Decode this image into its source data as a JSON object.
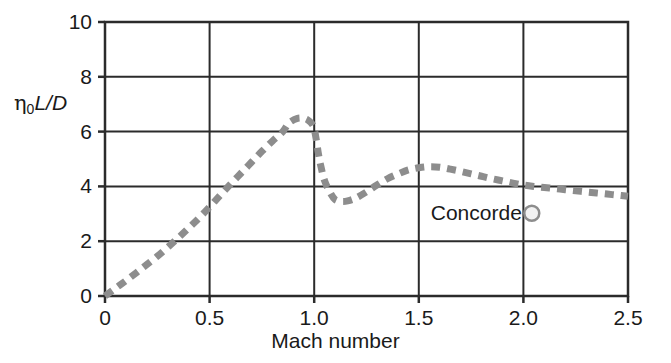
{
  "chart_data": {
    "type": "line",
    "title": "",
    "xlabel": "Mach number",
    "ylabel": "η0L/D",
    "ylabel_parts": {
      "symbol": "η",
      "subscript": "0",
      "italic": "L/D"
    },
    "xlim": [
      0,
      2.5
    ],
    "ylim": [
      0,
      10
    ],
    "xticks": [
      "0",
      "0.5",
      "1.0",
      "1.5",
      "2.0",
      "2.5"
    ],
    "xtick_values": [
      0,
      0.5,
      1.0,
      1.5,
      2.0,
      2.5
    ],
    "yticks": [
      "0",
      "2",
      "4",
      "6",
      "8",
      "10"
    ],
    "ytick_values": [
      0,
      2,
      4,
      6,
      8,
      10
    ],
    "grid": true,
    "grid_color": "#2b2b2b",
    "legend": null,
    "series": [
      {
        "name": "Overall efficiency envelope",
        "style": "dashed",
        "color": "#8d8d8d",
        "linewidth": 7,
        "dash": "9 7",
        "x": [
          0.0,
          0.05,
          0.1,
          0.15,
          0.2,
          0.25,
          0.3,
          0.35,
          0.4,
          0.45,
          0.5,
          0.55,
          0.6,
          0.65,
          0.7,
          0.75,
          0.8,
          0.85,
          0.88,
          0.92,
          0.95,
          0.97,
          0.99,
          1.0,
          1.01,
          1.02,
          1.03,
          1.05,
          1.08,
          1.1,
          1.13,
          1.16,
          1.2,
          1.25,
          1.3,
          1.35,
          1.4,
          1.45,
          1.5,
          1.55,
          1.6,
          1.65,
          1.7,
          1.75,
          1.8,
          1.85,
          1.9,
          1.95,
          2.0,
          2.05,
          2.1,
          2.15,
          2.2,
          2.25,
          2.3,
          2.35,
          2.4,
          2.45,
          2.5
        ],
        "y": [
          0.0,
          0.28,
          0.56,
          0.85,
          1.15,
          1.45,
          1.78,
          2.12,
          2.48,
          2.85,
          3.25,
          3.67,
          4.08,
          4.48,
          4.88,
          5.28,
          5.65,
          6.0,
          6.32,
          6.48,
          6.48,
          6.42,
          6.28,
          6.1,
          5.7,
          5.2,
          4.8,
          4.2,
          3.72,
          3.52,
          3.45,
          3.47,
          3.58,
          3.8,
          4.05,
          4.28,
          4.45,
          4.6,
          4.68,
          4.72,
          4.7,
          4.63,
          4.55,
          4.46,
          4.37,
          4.28,
          4.2,
          4.12,
          4.05,
          4.0,
          3.96,
          3.92,
          3.88,
          3.84,
          3.8,
          3.76,
          3.72,
          3.68,
          3.64
        ]
      }
    ],
    "annotations": [
      {
        "name": "concorde",
        "label": "Concorde",
        "marker": "open-circle",
        "marker_color": "#8d8d8d",
        "marker_fill": "#f2f2f2",
        "x": 2.04,
        "y": 3.02
      }
    ]
  },
  "axes": {
    "y_label_text": "L/D",
    "y_label_symbol": "η",
    "y_label_subscript": "0",
    "x_label_text": "Mach number"
  }
}
